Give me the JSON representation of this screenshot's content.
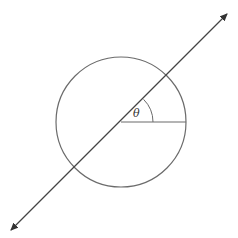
{
  "diagram": {
    "circle": {
      "cx": 121,
      "cy": 122,
      "r": 65,
      "stroke": "#6b6b6b"
    },
    "line": {
      "x1": 11,
      "y1": 230,
      "x2": 227,
      "y2": 14,
      "stroke": "#444444",
      "arrows": "both"
    },
    "radius": {
      "x1": 121,
      "y1": 122,
      "x2": 186,
      "y2": 122
    },
    "angle_arc": {
      "r": 32,
      "start_deg": 0,
      "end_deg": 45
    },
    "angle_label": {
      "text": "θ",
      "x": 137,
      "y": 116
    }
  }
}
